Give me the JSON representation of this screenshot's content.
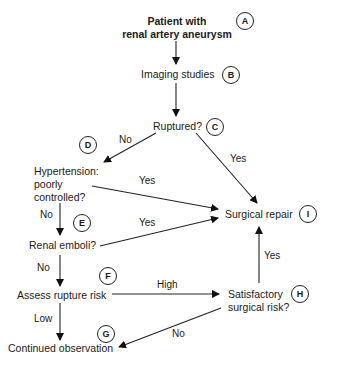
{
  "diagram": {
    "type": "flowchart",
    "title": "Patient with renal artery aneurysm",
    "nodes": [
      {
        "id": "A",
        "badge": "A",
        "line1": "Patient with",
        "line2": "renal artery aneurysm"
      },
      {
        "id": "B",
        "badge": "B",
        "label": "Imaging studies"
      },
      {
        "id": "C",
        "badge": "C",
        "label": "Ruptured?"
      },
      {
        "id": "D",
        "badge": "D",
        "line1": "Hypertension:",
        "line2": "poorly",
        "line3": "controlled?"
      },
      {
        "id": "E",
        "badge": "E",
        "label": "Renal emboli?"
      },
      {
        "id": "F",
        "badge": "F",
        "label": "Assess rupture risk"
      },
      {
        "id": "G",
        "badge": "G",
        "label": "Continued observation"
      },
      {
        "id": "H",
        "badge": "H",
        "line1": "Satisfactory",
        "line2": "surgical risk?"
      },
      {
        "id": "I",
        "badge": "I",
        "label": "Surgical repair"
      }
    ],
    "edges": [
      {
        "from": "A",
        "to": "B",
        "label": ""
      },
      {
        "from": "B",
        "to": "C",
        "label": ""
      },
      {
        "from": "C",
        "to": "D",
        "label": "No"
      },
      {
        "from": "C",
        "to": "I",
        "label": "Yes"
      },
      {
        "from": "D",
        "to": "I",
        "label": "Yes"
      },
      {
        "from": "D",
        "to": "E",
        "label": "No"
      },
      {
        "from": "E",
        "to": "I",
        "label": "Yes"
      },
      {
        "from": "E",
        "to": "F",
        "label": "No"
      },
      {
        "from": "F",
        "to": "H",
        "label": "High"
      },
      {
        "from": "F",
        "to": "G",
        "label": "Low"
      },
      {
        "from": "H",
        "to": "I",
        "label": "Yes"
      },
      {
        "from": "H",
        "to": "G",
        "label": "No"
      }
    ]
  }
}
